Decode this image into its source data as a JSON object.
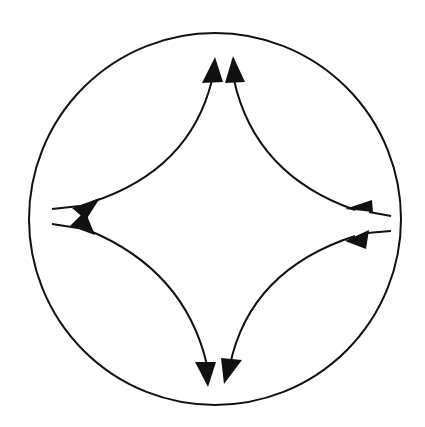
{
  "diagram": {
    "colors": {
      "stroke": "#111111",
      "background": "#ffffff"
    },
    "circle": {
      "cx": 215,
      "cy": 219,
      "r": 186
    },
    "nodes": [
      {
        "id": "top",
        "label": ""
      },
      {
        "id": "left",
        "label": ""
      },
      {
        "id": "right",
        "label": ""
      },
      {
        "id": "bottom",
        "label": ""
      }
    ],
    "edges": [
      {
        "from": "left",
        "to": "top",
        "arrows": "both"
      },
      {
        "from": "top",
        "to": "right",
        "arrows": "both"
      },
      {
        "from": "right",
        "to": "bottom",
        "arrows": "both"
      },
      {
        "from": "bottom",
        "to": "left",
        "arrows": "both"
      }
    ]
  }
}
